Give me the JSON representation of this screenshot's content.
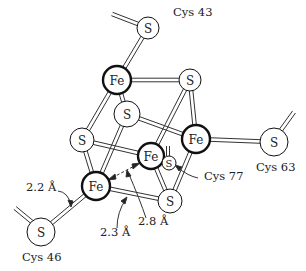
{
  "diagram": {
    "type": "molecular-structure",
    "atoms": [
      {
        "id": "S_cys43",
        "label": "S",
        "x": 148,
        "y": 28,
        "r": 11
      },
      {
        "id": "Fe1",
        "label": "Fe",
        "x": 117,
        "y": 80,
        "r": 14
      },
      {
        "id": "S1",
        "label": "S",
        "x": 190,
        "y": 80,
        "r": 11
      },
      {
        "id": "S2",
        "label": "S",
        "x": 127,
        "y": 114,
        "r": 13
      },
      {
        "id": "Fe2",
        "label": "Fe",
        "x": 196,
        "y": 139,
        "r": 14
      },
      {
        "id": "S3",
        "label": "S",
        "x": 82,
        "y": 140,
        "r": 12
      },
      {
        "id": "Fe3",
        "label": "Fe",
        "x": 151,
        "y": 156,
        "r": 13
      },
      {
        "id": "S_cys77",
        "label": "S",
        "x": 169,
        "y": 163,
        "r": 7
      },
      {
        "id": "Fe4",
        "label": "Fe",
        "x": 96,
        "y": 186,
        "r": 14
      },
      {
        "id": "S4",
        "label": "S",
        "x": 170,
        "y": 201,
        "r": 12
      },
      {
        "id": "S_cys46",
        "label": "S",
        "x": 41,
        "y": 232,
        "r": 14
      },
      {
        "id": "S_cys63",
        "label": "S",
        "x": 274,
        "y": 142,
        "r": 14
      }
    ],
    "ligand_labels": [
      {
        "text": "Cys 43",
        "x": 173,
        "y": 16
      },
      {
        "text": "Cys 63",
        "x": 256,
        "y": 171
      },
      {
        "text": "Cys 77",
        "x": 204,
        "y": 180
      },
      {
        "text": "Cys 46",
        "x": 22,
        "y": 261
      }
    ],
    "distance_labels": [
      {
        "text": "2.2 Å",
        "x": 26,
        "y": 191
      },
      {
        "text": "2.3 Å",
        "x": 100,
        "y": 236
      },
      {
        "text": "2.8 Å",
        "x": 138,
        "y": 225
      }
    ]
  }
}
